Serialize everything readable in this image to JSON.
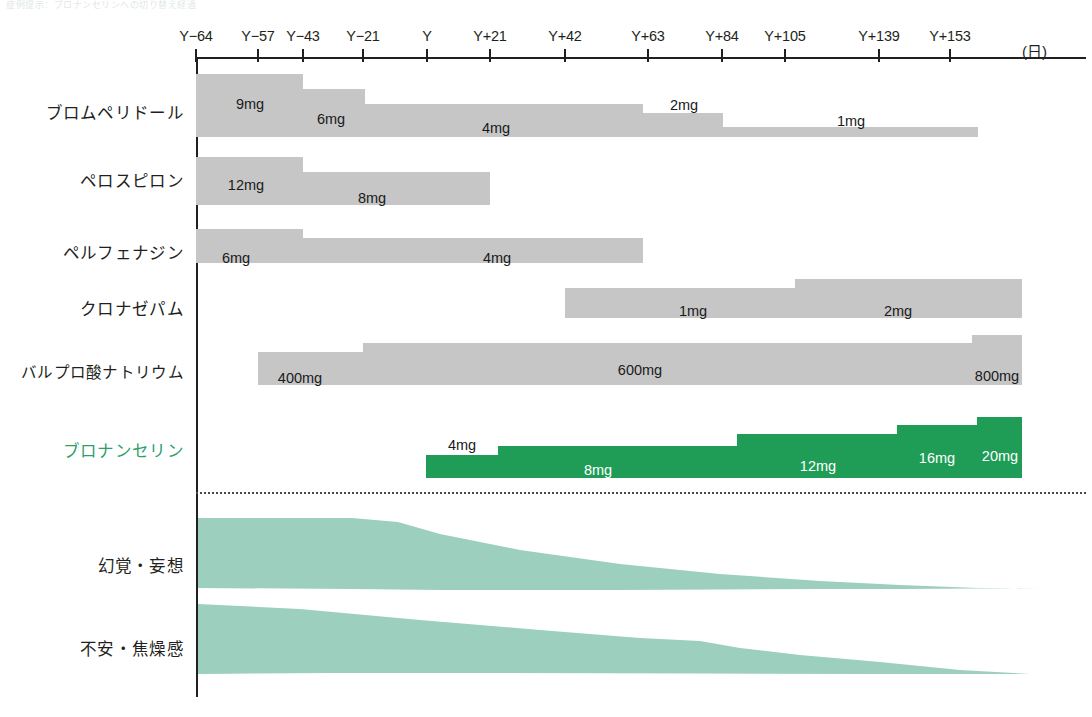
{
  "figure": {
    "faint_caption": "症例提示：ブロナンセリンへの切り替え経過",
    "axis_unit": "(日)",
    "accent_color": "#2ca06a",
    "bar_color": "#c6c6c6",
    "green_bar_color": "#1f9d57",
    "band_color": "#9ccfbe"
  },
  "chart_data": {
    "type": "bar",
    "title": "",
    "xlabel": "(日)",
    "ylabel": "",
    "grid": false,
    "legend": "none",
    "x_axis": {
      "ticks": [
        {
          "label": "Y-64",
          "px": 196
        },
        {
          "label": "Y-57",
          "px": 258
        },
        {
          "label": "Y-43",
          "px": 303
        },
        {
          "label": "Y-21",
          "px": 363
        },
        {
          "label": "Y",
          "px": 427
        },
        {
          "label": "Y+21",
          "px": 490
        },
        {
          "label": "Y+42",
          "px": 565
        },
        {
          "label": "Y+63",
          "px": 648
        },
        {
          "label": "Y+84",
          "px": 722
        },
        {
          "label": "Y+105",
          "px": 785
        },
        {
          "label": "Y+139",
          "px": 879
        },
        {
          "label": "Y+153",
          "px": 950
        }
      ]
    },
    "rows": [
      {
        "name": "ブロムペリドール",
        "label_y": 100,
        "color": "grey",
        "segments": [
          {
            "dose": "9mg",
            "x0": 196,
            "x1": 303,
            "top": 74,
            "bottom": 137,
            "label_x": 250,
            "label_y": 96,
            "label_color": "dark"
          },
          {
            "dose": "6mg",
            "x0": 303,
            "x1": 365,
            "top": 89,
            "bottom": 137,
            "label_x": 331,
            "label_y": 111,
            "label_color": "dark"
          },
          {
            "dose": "4mg",
            "x0": 365,
            "x1": 643,
            "top": 104,
            "bottom": 137,
            "label_x": 496,
            "label_y": 120,
            "label_color": "dark"
          },
          {
            "dose": "2mg",
            "x0": 643,
            "x1": 723,
            "top": 113,
            "bottom": 137,
            "label_x": 684,
            "label_y": 97,
            "label_color": "dark"
          },
          {
            "dose": "1mg",
            "x0": 723,
            "x1": 978,
            "top": 127,
            "bottom": 137,
            "label_x": 851,
            "label_y": 113,
            "label_color": "dark"
          }
        ]
      },
      {
        "name": "ペロスピロン",
        "label_y": 168,
        "color": "grey",
        "segments": [
          {
            "dose": "12mg",
            "x0": 196,
            "x1": 303,
            "top": 157,
            "bottom": 205,
            "label_x": 246,
            "label_y": 177,
            "label_color": "dark"
          },
          {
            "dose": "8mg",
            "x0": 303,
            "x1": 490,
            "top": 172,
            "bottom": 205,
            "label_x": 372,
            "label_y": 190,
            "label_color": "dark"
          }
        ]
      },
      {
        "name": "ペルフェナジン",
        "label_y": 240,
        "color": "grey",
        "segments": [
          {
            "dose": "6mg",
            "x0": 196,
            "x1": 303,
            "top": 229,
            "bottom": 263,
            "label_x": 236,
            "label_y": 250,
            "label_color": "dark"
          },
          {
            "dose": "4mg",
            "x0": 303,
            "x1": 643,
            "top": 238,
            "bottom": 263,
            "label_x": 497,
            "label_y": 250,
            "label_color": "dark"
          }
        ]
      },
      {
        "name": "クロナゼパム",
        "label_y": 296,
        "color": "grey",
        "segments": [
          {
            "dose": "1mg",
            "x0": 565,
            "x1": 795,
            "top": 288,
            "bottom": 318,
            "label_x": 693,
            "label_y": 303,
            "label_color": "dark"
          },
          {
            "dose": "2mg",
            "x0": 795,
            "x1": 1022,
            "top": 279,
            "bottom": 318,
            "label_x": 898,
            "label_y": 303,
            "label_color": "dark"
          }
        ]
      },
      {
        "name": "バルプロ酸ナトリウム",
        "label_y": 360,
        "color": "grey",
        "segments": [
          {
            "dose": "400mg",
            "x0": 258,
            "x1": 363,
            "top": 352,
            "bottom": 385,
            "label_x": 300,
            "label_y": 370,
            "label_color": "dark"
          },
          {
            "dose": "600mg",
            "x0": 363,
            "x1": 972,
            "top": 343,
            "bottom": 385,
            "label_x": 640,
            "label_y": 362,
            "label_color": "dark"
          },
          {
            "dose": "800mg",
            "x0": 972,
            "x1": 1022,
            "top": 335,
            "bottom": 385,
            "label_x": 997,
            "label_y": 368,
            "label_color": "dark"
          }
        ]
      },
      {
        "name": "ブロナンセリン",
        "label_y": 438,
        "color": "green",
        "segments": [
          {
            "dose": "4mg",
            "x0": 426,
            "x1": 498,
            "top": 455,
            "bottom": 478,
            "label_x": 462,
            "label_y": 437,
            "label_color": "dark"
          },
          {
            "dose": "8mg",
            "x0": 498,
            "x1": 737,
            "top": 446,
            "bottom": 478,
            "label_x": 598,
            "label_y": 462,
            "label_color": "white"
          },
          {
            "dose": "12mg",
            "x0": 737,
            "x1": 897,
            "top": 434,
            "bottom": 478,
            "label_x": 818,
            "label_y": 458,
            "label_color": "white"
          },
          {
            "dose": "16mg",
            "x0": 897,
            "x1": 977,
            "top": 425,
            "bottom": 478,
            "label_x": 937,
            "label_y": 450,
            "label_color": "white"
          },
          {
            "dose": "20mg",
            "x0": 977,
            "x1": 1022,
            "top": 417,
            "bottom": 478,
            "label_x": 1000,
            "label_y": 448,
            "label_color": "white"
          }
        ]
      }
    ],
    "symptom_bands": [
      {
        "name": "幻覚・妄想",
        "label_y": 553,
        "upper": "M 198,518 L 352,518 L 398,522 L 440,534 L 520,550 L 620,564 L 720,574 L 820,581 L 900,585 L 978,588 L 1040,589",
        "lower": "M 198,588 L 352,589 L 440,590 L 620,590 L 820,589 L 900,589 L 978,588.6 L 1040,589",
        "severity_note": "高レベルから漸減し Y+105 以降でほぼ消失"
      },
      {
        "name": "不安・焦燥感",
        "label_y": 636,
        "upper": "M 198,604 L 300,609 L 420,620 L 540,630 L 640,638 L 700,641 L 740,648 L 800,655 L 880,662 L 960,670 L 1030,674",
        "lower": "M 198,674 L 330,673 L 500,673 L 700,673.5 L 880,674 L 960,674 L 1030,674",
        "severity_note": "中等度から漸減し終盤でほぼ消失"
      }
    ]
  }
}
